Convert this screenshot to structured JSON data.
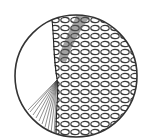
{
  "figure": {
    "stroke_color": "#2a2a2a",
    "background_color": "#ffffff",
    "circle": {
      "cx": 76,
      "cy": 76,
      "r": 62
    }
  }
}
